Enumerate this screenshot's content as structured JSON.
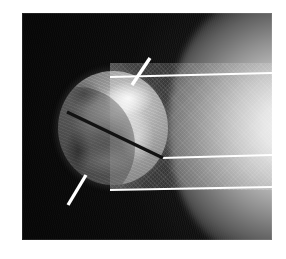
{
  "figure": {
    "alt_text": "Dark grainy sky with an illuminated circular occulting disk at left, a lighter rectangular instrument field crossed by white guide lines, a dark diagonal radial line, two short white tick marks, and a bright solar limb at the right edge.",
    "plate": {
      "x": 22,
      "y": 13,
      "width": 250,
      "height": 227,
      "background_color": "#0d0d0d"
    },
    "border_color": "#ffffff"
  },
  "objects": {
    "disk": {
      "name": "occulting-disk",
      "center_x": 113,
      "center_y": 128,
      "radius_x": 55,
      "radius_y": 57,
      "fill_light": "#d6d6d6",
      "fill_dark": "#5c5c5c"
    },
    "limb": {
      "name": "solar-limb",
      "edge": "right",
      "highlight_color": "#f2f2f2",
      "falloff_color": "#1e1e1e"
    },
    "field": {
      "name": "instrument-field",
      "x": 110,
      "y": 63,
      "width": 162,
      "height": 127,
      "tint_color": "#bebebe"
    }
  },
  "annotations": {
    "line_color": "#ffffff",
    "radial_line_color": "#111111",
    "guide_lines": [
      {
        "label": "upper-guide-line",
        "x1": 110,
        "y1": 77,
        "x2": 272,
        "y2": 73
      },
      {
        "label": "middle-guide-line",
        "x1": 161,
        "y1": 158,
        "x2": 272,
        "y2": 155
      },
      {
        "label": "lower-guide-line",
        "x1": 110,
        "y1": 190,
        "x2": 272,
        "y2": 187
      }
    ],
    "radial_line": {
      "label": "radial-cut-line",
      "x1": 67,
      "y1": 112,
      "x2": 163,
      "y2": 158
    },
    "tick_marks": [
      {
        "label": "upper-tick-mark",
        "x1": 150,
        "y1": 58,
        "x2": 132,
        "y2": 85
      },
      {
        "label": "lower-tick-mark",
        "x1": 86,
        "y1": 175,
        "x2": 68,
        "y2": 205
      }
    ]
  }
}
